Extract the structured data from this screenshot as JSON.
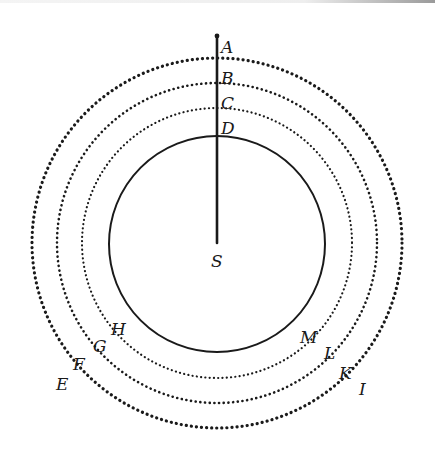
{
  "diagram": {
    "type": "concentric-circles",
    "center": {
      "label": "S",
      "x": 217,
      "y": 242
    },
    "radial_line": {
      "from": "S",
      "to": "A"
    },
    "circles": [
      {
        "name": "outer-orbit",
        "radius": 185,
        "style": "dotted",
        "points": [
          "A",
          "E",
          "I"
        ]
      },
      {
        "name": "second-orbit",
        "radius": 160,
        "style": "dotted",
        "points": [
          "B",
          "F",
          "K"
        ]
      },
      {
        "name": "third-orbit",
        "radius": 135,
        "style": "dotted",
        "points": [
          "C",
          "G",
          "L"
        ]
      },
      {
        "name": "inner-body",
        "radius": 108,
        "style": "solid",
        "points": [
          "D",
          "H",
          "M"
        ]
      }
    ],
    "labels": {
      "A": "A",
      "B": "B",
      "C": "C",
      "D": "D",
      "E": "E",
      "F": "F",
      "G": "G",
      "H": "H",
      "I": "I",
      "K": "K",
      "L": "L",
      "M": "M",
      "S": "S"
    },
    "colors": {
      "ink": "#1a1a1a",
      "paper": "#ffffff"
    }
  }
}
